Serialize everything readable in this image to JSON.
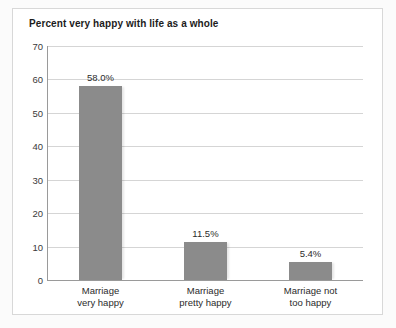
{
  "chart_data": {
    "type": "bar",
    "title": "Percent very happy with life as a whole",
    "xlabel": "",
    "ylabel": "",
    "ylim": [
      0,
      70
    ],
    "ytick_step": 10,
    "yticks": [
      70,
      60,
      50,
      40,
      30,
      20,
      10,
      0
    ],
    "grid": true,
    "legend": false,
    "legend_position": "none",
    "categories": [
      "Marriage very happy",
      "Marriage pretty happy",
      "Marriage not too happy"
    ],
    "category_lines": [
      [
        "Marriage",
        "very happy"
      ],
      [
        "Marriage",
        "pretty happy"
      ],
      [
        "Marriage not",
        "too happy"
      ]
    ],
    "values": [
      58.0,
      11.5,
      5.4
    ],
    "data_labels": [
      "58.0%",
      "11.5%",
      "5.4%"
    ],
    "bar_color": "#8b8b8b",
    "grid_color": "#d5d5d5",
    "axis_color": "#9a9a9a",
    "panel_background": "#ffffff",
    "figure_background": "#fbfbfb",
    "text_color": "#2b2b2b",
    "title_color": "#1c1c1c"
  }
}
